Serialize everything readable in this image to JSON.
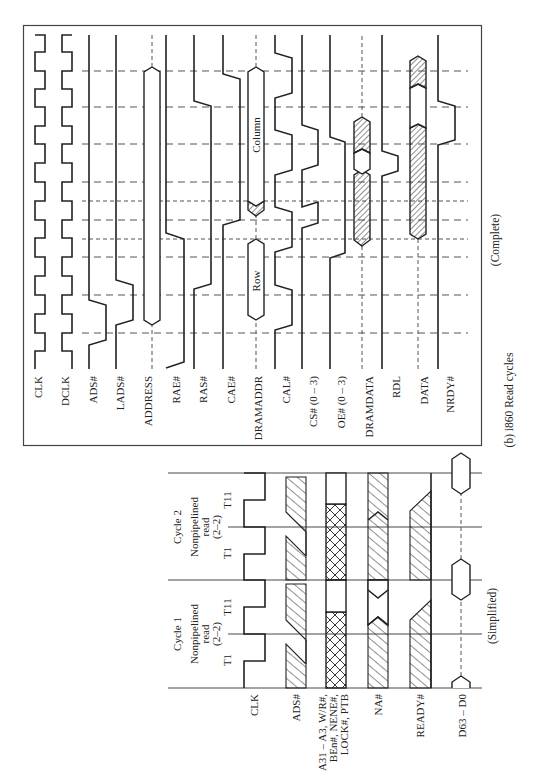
{
  "figure": {
    "caption": "(b) i860 Read cycles",
    "complete_label": "(Complete)",
    "simplified_label": "(Simplified)",
    "orientation": "rotated 90° counter-clockwise; time runs bottom-to-top"
  },
  "complete": {
    "signals": [
      {
        "id": "clk",
        "label": "CLK"
      },
      {
        "id": "dclk",
        "label": "DCLK"
      },
      {
        "id": "ads",
        "label": "ADS#"
      },
      {
        "id": "lads",
        "label": "LADS#"
      },
      {
        "id": "address",
        "label": "ADDRESS"
      },
      {
        "id": "rae",
        "label": "RAE#"
      },
      {
        "id": "ras",
        "label": "RAS#"
      },
      {
        "id": "cae",
        "label": "CAE#"
      },
      {
        "id": "dramaddr",
        "label": "DRAMADDR"
      },
      {
        "id": "cal",
        "label": "CAL#"
      },
      {
        "id": "cs",
        "label": "CS# (0 – 3)"
      },
      {
        "id": "oe",
        "label": "OE# (0 – 3)"
      },
      {
        "id": "dramdata",
        "label": "DRAMDATA"
      },
      {
        "id": "rdl",
        "label": "RDL"
      },
      {
        "id": "data",
        "label": "DATA"
      },
      {
        "id": "nrdy",
        "label": "NRDY#"
      }
    ],
    "bus_labels": {
      "row": "Row",
      "column": "Column"
    }
  },
  "simplified": {
    "cycles": [
      {
        "title": "Cycle 1",
        "line1": "Nonpipelined",
        "line2": "read",
        "line3": "(2–2)",
        "states": [
          "T1",
          "T11"
        ]
      },
      {
        "title": "Cycle 2",
        "line1": "Nonpipelined",
        "line2": "read",
        "line3": "(2–2)",
        "states": [
          "T1",
          "T11"
        ]
      }
    ],
    "signals": [
      {
        "id": "clk",
        "label": "CLK"
      },
      {
        "id": "ads",
        "label": "ADS#"
      },
      {
        "id": "addr",
        "label_lines": [
          "A31 – A3, W/R#,",
          "BEn#, NENE#,",
          "LOCK#, PTB"
        ]
      },
      {
        "id": "na",
        "label": "NA#"
      },
      {
        "id": "ready",
        "label": "READY#"
      },
      {
        "id": "data",
        "label": "D63 – D0"
      }
    ]
  }
}
